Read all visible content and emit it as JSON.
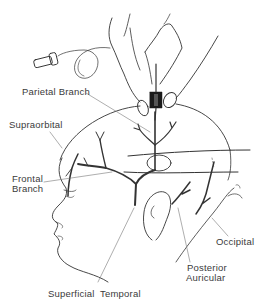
{
  "figure": {
    "line_color": "#333333",
    "labels": {
      "parietal_branch": "Parietal Branch",
      "supraorbital": "Supraorbital",
      "frontal_branch_line1": "Frontal",
      "frontal_branch_line2": "Branch",
      "occipital": "Occipital",
      "posterior_auricular_line1": "Posterior",
      "posterior_auricular_line2": "Auricular",
      "superficial_temporal": "Superficial  Temporal"
    }
  }
}
